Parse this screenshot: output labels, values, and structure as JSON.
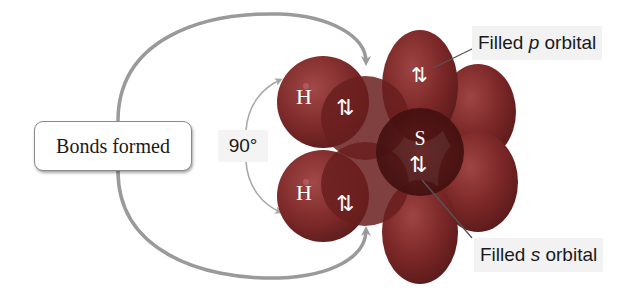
{
  "diagram": {
    "type": "orbital-bonding-model",
    "molecule": "H2S",
    "central_atom": "S",
    "bonded_atoms": [
      "H",
      "H"
    ]
  },
  "labels": {
    "bonds_formed": "Bonds formed",
    "bond_angle": "90°",
    "filled_p": {
      "prefix": "Filled ",
      "orbital": "p",
      "suffix": " orbital"
    },
    "filled_s": {
      "prefix": "Filled ",
      "orbital": "s",
      "suffix": " orbital"
    }
  },
  "atoms": {
    "h_top": "H",
    "h_bottom": "H",
    "sulfur": "S"
  },
  "electron_pairs": {
    "bond_top": "⇅",
    "bond_bottom": "⇅",
    "p_lone_pair": "⇅",
    "s_lone_pair": "⇅"
  },
  "colors": {
    "lobe_fill": "#7a2626",
    "lobe_dark": "#4e1414",
    "lobe_light": "#a04545",
    "arrow": "#9a9a9a",
    "leader_line": "#555555",
    "text_on_lobe": "#ffffff",
    "label_bg": "#f2f2f2"
  }
}
